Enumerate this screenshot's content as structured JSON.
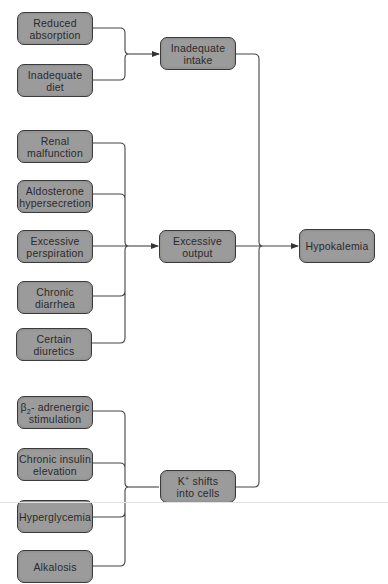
{
  "diagram": {
    "type": "flowchart",
    "colors": {
      "node_fill": "#9b9b9b",
      "node_border": "#3a3a3a",
      "connector": "#444444",
      "text": "#2a2a2a",
      "background": "#ffffff"
    },
    "outcome": {
      "id": "hypokalemia",
      "label": "Hypokalemia"
    },
    "groups": [
      {
        "id": "inadequate-intake",
        "label": "Inadequate\nintake",
        "causes": [
          {
            "id": "reduced-absorption",
            "label": "Reduced\nabsorption"
          },
          {
            "id": "inadequate-diet",
            "label": "Inadequate\ndiet"
          }
        ]
      },
      {
        "id": "excessive-output",
        "label": "Excessive\noutput",
        "causes": [
          {
            "id": "renal-malfunction",
            "label": "Renal\nmalfunction"
          },
          {
            "id": "aldosterone-hypersecretion",
            "label": "Aldosterone\nhypersecretion"
          },
          {
            "id": "excessive-perspiration",
            "label": "Excessive\nperspiration"
          },
          {
            "id": "chronic-diarrhea",
            "label": "Chronic\ndiarrhea"
          },
          {
            "id": "certain-diuretics",
            "label": "Certain\ndiuretics"
          }
        ]
      },
      {
        "id": "k-shifts-into-cells",
        "label_prefix": "K",
        "label_sup": "+",
        "label_rest": " shifts\ninto cells",
        "causes": [
          {
            "id": "beta2-adrenergic-stimulation",
            "label_prefix": "β",
            "label_sub": "2",
            "label_rest": "- adrenergic\nstimulation"
          },
          {
            "id": "chronic-insulin-elevation",
            "label": "Chronic insulin\nelevation"
          },
          {
            "id": "hyperglycemia",
            "label": "Hyperglycemia"
          },
          {
            "id": "alkalosis",
            "label": "Alkalosis"
          }
        ]
      }
    ]
  }
}
